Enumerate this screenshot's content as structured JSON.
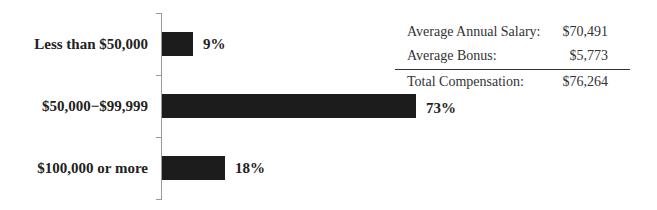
{
  "chart_data": {
    "type": "bar",
    "orientation": "horizontal",
    "categories": [
      "Less than $50,000",
      "$50,000−$99,999",
      "$100,000 or more"
    ],
    "values": [
      9,
      73,
      18
    ],
    "value_labels": [
      "9%",
      "73%",
      "18%"
    ],
    "unit": "%",
    "title": "",
    "xlabel": "",
    "ylabel": "",
    "xlim": [
      0,
      80
    ],
    "grid": false,
    "legend": null,
    "bar_color": "#1c1c1c"
  },
  "summary_table": {
    "rows": [
      {
        "label": "Average Annual Salary:",
        "value": "$70,491"
      },
      {
        "label": "Average Bonus:",
        "value": "$5,773"
      }
    ],
    "total": {
      "label": "Total Compensation:",
      "value": "$76,264"
    }
  }
}
